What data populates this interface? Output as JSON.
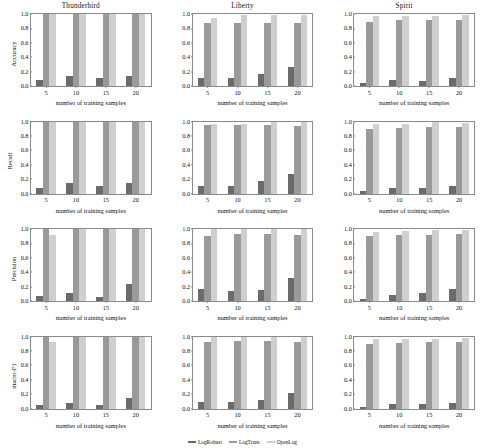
{
  "figure": {
    "xlabel": "number of training samples",
    "columns": [
      "Thunderbird",
      "Liberty",
      "Spirit"
    ],
    "rows": [
      "Accuracy",
      "Recall",
      "Precision",
      "macro-F1"
    ],
    "yticks": [
      "0.0",
      "0.2",
      "0.4",
      "0.6",
      "0.8",
      "1.0"
    ],
    "xticks": [
      "5",
      "10",
      "15",
      "20"
    ]
  },
  "legend": {
    "position": "bottom-center",
    "items": [
      {
        "label": "LogRobust",
        "color": "#6b6b6b"
      },
      {
        "label": "LogTrans",
        "color": "#9a9a9a"
      },
      {
        "label": "OpenLog",
        "color": "#cfcfcf"
      }
    ]
  },
  "colors": {
    "log_robust": "#6b6b6b",
    "log_trans": "#9a9a9a",
    "open_log": "#cfcfcf",
    "axis": "#8a8a8a",
    "background": "#ffffff"
  },
  "chart_data": {
    "type": "bar",
    "title": "",
    "xlabel": "number of training samples",
    "ylim": [
      0.0,
      1.0
    ],
    "grid": false,
    "legend_position": "bottom-center",
    "categories": [
      "5",
      "10",
      "15",
      "20"
    ],
    "panels": [
      {
        "row": "Accuracy",
        "column": "Thunderbird",
        "ylabel": "Accuracy",
        "series": [
          {
            "name": "LogRobust",
            "values": [
              0.09,
              0.14,
              0.11,
              0.14
            ]
          },
          {
            "name": "LogTrans",
            "values": [
              1.0,
              1.0,
              1.0,
              1.0
            ]
          },
          {
            "name": "OpenLog",
            "values": [
              1.0,
              1.0,
              1.0,
              1.0
            ]
          }
        ]
      },
      {
        "row": "Accuracy",
        "column": "Liberty",
        "ylabel": "Accuracy",
        "series": [
          {
            "name": "LogRobust",
            "values": [
              0.11,
              0.11,
              0.17,
              0.27
            ]
          },
          {
            "name": "LogTrans",
            "values": [
              0.88,
              0.88,
              0.88,
              0.88
            ]
          },
          {
            "name": "OpenLog",
            "values": [
              0.95,
              0.99,
              0.99,
              0.99
            ]
          }
        ]
      },
      {
        "row": "Accuracy",
        "column": "Spirit",
        "ylabel": "Accuracy",
        "series": [
          {
            "name": "LogRobust",
            "values": [
              0.04,
              0.08,
              0.07,
              0.11
            ]
          },
          {
            "name": "LogTrans",
            "values": [
              0.89,
              0.91,
              0.91,
              0.92
            ]
          },
          {
            "name": "OpenLog",
            "values": [
              0.97,
              0.97,
              0.97,
              0.98
            ]
          }
        ]
      },
      {
        "row": "Recall",
        "column": "Thunderbird",
        "ylabel": "Recall",
        "series": [
          {
            "name": "LogRobust",
            "values": [
              0.08,
              0.14,
              0.11,
              0.14
            ]
          },
          {
            "name": "LogTrans",
            "values": [
              1.0,
              1.0,
              1.0,
              1.0
            ]
          },
          {
            "name": "OpenLog",
            "values": [
              1.0,
              1.0,
              1.0,
              1.0
            ]
          }
        ]
      },
      {
        "row": "Recall",
        "column": "Liberty",
        "ylabel": "Recall",
        "series": [
          {
            "name": "LogRobust",
            "values": [
              0.11,
              0.11,
              0.18,
              0.27
            ]
          },
          {
            "name": "LogTrans",
            "values": [
              0.95,
              0.95,
              0.95,
              0.94
            ]
          },
          {
            "name": "OpenLog",
            "values": [
              0.97,
              0.97,
              0.99,
              0.99
            ]
          }
        ]
      },
      {
        "row": "Recall",
        "column": "Spirit",
        "ylabel": "Recall",
        "series": [
          {
            "name": "LogRobust",
            "values": [
              0.04,
              0.08,
              0.07,
              0.11
            ]
          },
          {
            "name": "LogTrans",
            "values": [
              0.89,
              0.91,
              0.92,
              0.93
            ]
          },
          {
            "name": "OpenLog",
            "values": [
              0.96,
              0.97,
              0.99,
              0.98
            ]
          }
        ]
      },
      {
        "row": "Precision",
        "column": "Thunderbird",
        "ylabel": "Precision",
        "series": [
          {
            "name": "LogRobust",
            "values": [
              0.07,
              0.11,
              0.05,
              0.24
            ]
          },
          {
            "name": "LogTrans",
            "values": [
              1.0,
              1.0,
              1.0,
              1.0
            ]
          },
          {
            "name": "OpenLog",
            "values": [
              0.92,
              1.0,
              1.0,
              1.0
            ]
          }
        ]
      },
      {
        "row": "Precision",
        "column": "Liberty",
        "ylabel": "Precision",
        "series": [
          {
            "name": "LogRobust",
            "values": [
              0.17,
              0.14,
              0.15,
              0.32
            ]
          },
          {
            "name": "LogTrans",
            "values": [
              0.9,
              0.93,
              0.93,
              0.92
            ]
          },
          {
            "name": "OpenLog",
            "values": [
              1.0,
              1.0,
              1.0,
              1.0
            ]
          }
        ]
      },
      {
        "row": "Precision",
        "column": "Spirit",
        "ylabel": "Precision",
        "series": [
          {
            "name": "LogRobust",
            "values": [
              0.03,
              0.08,
              0.11,
              0.17
            ]
          },
          {
            "name": "LogTrans",
            "values": [
              0.9,
              0.92,
              0.92,
              0.93
            ]
          },
          {
            "name": "OpenLog",
            "values": [
              0.96,
              0.97,
              0.98,
              0.98
            ]
          }
        ]
      },
      {
        "row": "macro-F1",
        "column": "Thunderbird",
        "ylabel": "macro-F1",
        "series": [
          {
            "name": "LogRobust",
            "values": [
              0.05,
              0.07,
              0.05,
              0.14
            ]
          },
          {
            "name": "LogTrans",
            "values": [
              1.0,
              1.0,
              1.0,
              1.0
            ]
          },
          {
            "name": "OpenLog",
            "values": [
              0.92,
              1.0,
              1.0,
              1.0
            ]
          }
        ]
      },
      {
        "row": "macro-F1",
        "column": "Liberty",
        "ylabel": "macro-F1",
        "series": [
          {
            "name": "LogRobust",
            "values": [
              0.09,
              0.09,
              0.12,
              0.21
            ]
          },
          {
            "name": "LogTrans",
            "values": [
              0.92,
              0.94,
              0.94,
              0.93
            ]
          },
          {
            "name": "OpenLog",
            "values": [
              0.99,
              0.99,
              1.0,
              1.0
            ]
          }
        ]
      },
      {
        "row": "macro-F1",
        "column": "Spirit",
        "ylabel": "macro-F1",
        "series": [
          {
            "name": "LogRobust",
            "values": [
              0.02,
              0.06,
              0.06,
              0.08
            ]
          },
          {
            "name": "LogTrans",
            "values": [
              0.89,
              0.91,
              0.92,
              0.93
            ]
          },
          {
            "name": "OpenLog",
            "values": [
              0.96,
              0.96,
              0.97,
              0.98
            ]
          }
        ]
      }
    ]
  }
}
